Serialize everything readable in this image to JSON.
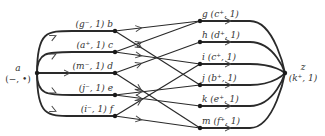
{
  "diagram": {
    "type": "network-flow-graph",
    "source": {
      "id": "a",
      "name": "a",
      "label": "(−, •)",
      "x": 37,
      "y": 73
    },
    "sink": {
      "id": "z",
      "name": "z",
      "label": "(k⁺, 1)",
      "x": 285,
      "y": 73
    },
    "left_nodes": [
      {
        "id": "b",
        "label": "(g⁻, 1) b",
        "x": 115,
        "y": 31
      },
      {
        "id": "c",
        "label": "(a⁺, 1) c",
        "x": 115,
        "y": 52
      },
      {
        "id": "d",
        "label": "(m⁻, 1) d",
        "x": 115,
        "y": 73
      },
      {
        "id": "e",
        "label": "(j⁻, 1) e",
        "x": 115,
        "y": 95
      },
      {
        "id": "f",
        "label": "(i⁻, 1) f",
        "x": 115,
        "y": 116
      }
    ],
    "right_nodes": [
      {
        "id": "g",
        "label": "g (c⁺, 1)",
        "x": 200,
        "y": 21
      },
      {
        "id": "h",
        "label": "h (d⁺, 1)",
        "x": 200,
        "y": 42
      },
      {
        "id": "i",
        "label": "i (c⁺, 1)",
        "x": 200,
        "y": 64
      },
      {
        "id": "j",
        "label": "j (b⁺, 1)",
        "x": 200,
        "y": 85
      },
      {
        "id": "k",
        "label": "k (e⁺, 1)",
        "x": 200,
        "y": 106
      },
      {
        "id": "m",
        "label": "m (f⁺, 1)",
        "x": 200,
        "y": 128
      }
    ],
    "edges": [
      {
        "from": "a",
        "to": "b"
      },
      {
        "from": "a",
        "to": "c"
      },
      {
        "from": "a",
        "to": "d"
      },
      {
        "from": "a",
        "to": "e"
      },
      {
        "from": "a",
        "to": "f"
      },
      {
        "from": "b",
        "to": "g"
      },
      {
        "from": "b",
        "to": "j"
      },
      {
        "from": "c",
        "to": "g"
      },
      {
        "from": "c",
        "to": "i"
      },
      {
        "from": "d",
        "to": "h"
      },
      {
        "from": "d",
        "to": "m"
      },
      {
        "from": "e",
        "to": "j"
      },
      {
        "from": "e",
        "to": "k"
      },
      {
        "from": "f",
        "to": "i"
      },
      {
        "from": "f",
        "to": "m"
      },
      {
        "from": "g",
        "to": "z"
      },
      {
        "from": "h",
        "to": "z"
      },
      {
        "from": "i",
        "to": "z"
      },
      {
        "from": "j",
        "to": "z"
      },
      {
        "from": "k",
        "to": "z"
      },
      {
        "from": "m",
        "to": "z"
      }
    ]
  }
}
